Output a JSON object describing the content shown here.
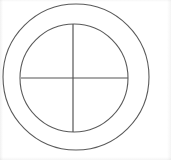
{
  "figure": {
    "background_color": "#ffffff",
    "width": 171,
    "height": 160,
    "caption": ""
  },
  "chart_data": {
    "type": "diagram",
    "background": "#ffffff",
    "shapes": [
      {
        "name": "outer-circle",
        "type": "circle",
        "cx": 76,
        "cy": 77,
        "r": 73,
        "stroke": "#5a5a5a",
        "stroke_width": 1.1,
        "fill": "none"
      },
      {
        "name": "inner-circle",
        "type": "circle",
        "cx": 74,
        "cy": 78,
        "r": 54,
        "stroke": "#5a5a5a",
        "stroke_width": 1.1,
        "fill": "none"
      },
      {
        "name": "vertical-diameter",
        "type": "line",
        "x1": 73,
        "y1": 24,
        "x2": 73,
        "y2": 132,
        "stroke": "#555555",
        "stroke_width": 1.2
      },
      {
        "name": "horizontal-diameter",
        "type": "line",
        "x1": 21,
        "y1": 78,
        "x2": 128,
        "y2": 78,
        "stroke": "#555555",
        "stroke_width": 1.2
      }
    ],
    "center_point": {
      "x": 73,
      "y": 78
    },
    "ring_thickness": 19,
    "quadrant_count": 4,
    "labels": [],
    "legend": [],
    "grid": false
  }
}
